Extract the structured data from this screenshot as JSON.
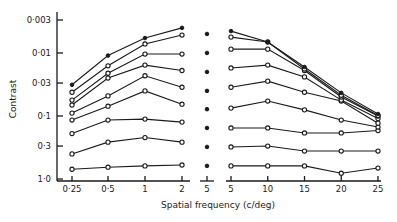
{
  "chart_data": {
    "type": "line",
    "title": "",
    "xlabel": "Spatial frequency (c/deg)",
    "ylabel": "Contrast",
    "y_scale": "log",
    "y_inverted": true,
    "ylim": [
      0.003,
      1.0
    ],
    "y_ticks": [
      0.003,
      0.01,
      0.03,
      0.1,
      0.3,
      1.0
    ],
    "y_tick_labels": [
      "0·003",
      "0·01",
      "0·03",
      "0·1",
      "0·3",
      "1·0"
    ],
    "grid": false,
    "legend": null,
    "panels": [
      {
        "name": "left",
        "x_scale": "log",
        "x": [
          0.25,
          0.5,
          1,
          2
        ],
        "x_tick_labels": [
          "0·25",
          "0·5",
          "1",
          "2"
        ]
      },
      {
        "name": "middle",
        "x": [
          5
        ],
        "x_tick_labels": [
          "5"
        ],
        "points": [
          0.005,
          0.01,
          0.02,
          0.04,
          0.078,
          0.155,
          0.31,
          0.62
        ],
        "marker": "filled"
      },
      {
        "name": "right",
        "x_scale": "linear",
        "x": [
          5,
          10,
          15,
          20,
          25
        ],
        "x_tick_labels": [
          "5",
          "10",
          "15",
          "20",
          "25"
        ]
      }
    ],
    "series": [
      {
        "name": "series-1",
        "marker": "filled",
        "left": [
          0.032,
          0.011,
          0.0058,
          0.004
        ],
        "right": [
          0.0045,
          0.0067,
          0.0167,
          0.043,
          0.093
        ]
      },
      {
        "name": "series-2",
        "marker": "open",
        "left": [
          0.042,
          0.016,
          0.0072,
          0.0052
        ],
        "right": [
          0.0056,
          0.0067,
          0.018,
          0.047,
          0.098
        ]
      },
      {
        "name": "series-3",
        "marker": "open",
        "left": [
          0.056,
          0.021,
          0.0104,
          0.0104
        ],
        "right": [
          0.0087,
          0.0087,
          0.019,
          0.05,
          0.1
        ]
      },
      {
        "name": "series-4",
        "marker": "open",
        "left": [
          0.067,
          0.025,
          0.0156,
          0.019
        ],
        "right": [
          0.0173,
          0.0156,
          0.024,
          0.056,
          0.11
        ]
      },
      {
        "name": "series-5",
        "marker": "open",
        "left": [
          0.09,
          0.048,
          0.023,
          0.035
        ],
        "right": [
          0.035,
          0.028,
          0.042,
          0.058,
          0.13
        ]
      },
      {
        "name": "series-6",
        "marker": "open",
        "left": [
          0.116,
          0.07,
          0.04,
          0.065
        ],
        "right": [
          0.075,
          0.058,
          0.08,
          0.116,
          0.15
        ]
      },
      {
        "name": "series-7",
        "marker": "open",
        "left": [
          0.19,
          0.116,
          0.112,
          0.125
        ],
        "right": [
          0.155,
          0.155,
          0.186,
          0.186,
          0.17
        ]
      },
      {
        "name": "series-8",
        "marker": "open",
        "left": [
          0.4,
          0.26,
          0.22,
          0.26
        ],
        "right": [
          0.31,
          0.3,
          0.36,
          0.36,
          0.36
        ]
      },
      {
        "name": "series-9",
        "marker": "open",
        "left": [
          0.7,
          0.65,
          0.62,
          0.6
        ],
        "right": [
          0.62,
          0.62,
          0.62,
          0.81,
          0.67
        ]
      }
    ]
  },
  "colors": {
    "ink": "#1a1a1a",
    "background": "#ffffff"
  }
}
